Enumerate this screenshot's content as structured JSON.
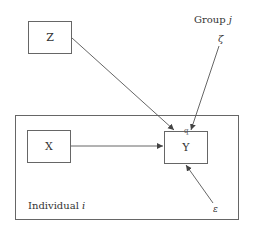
{
  "diagram": {
    "type": "multilevel path diagram",
    "nodes": {
      "z": {
        "label": "Z"
      },
      "x": {
        "label": "X"
      },
      "y": {
        "label": "Y",
        "marker": "q"
      }
    },
    "error_terms": {
      "zeta": {
        "label": "ζ"
      },
      "epsilon": {
        "label": "ε"
      }
    },
    "levels": {
      "group": {
        "label": "Group",
        "index": "j"
      },
      "individual": {
        "label": "Individual",
        "index": "i"
      }
    },
    "edges": [
      {
        "from": "Z",
        "to": "Y"
      },
      {
        "from": "ζ",
        "to": "Y"
      },
      {
        "from": "X",
        "to": "Y"
      },
      {
        "from": "ε",
        "to": "Y"
      }
    ],
    "colors": {
      "line": "#555555",
      "box_border": "#666666",
      "text": "#333333"
    }
  }
}
